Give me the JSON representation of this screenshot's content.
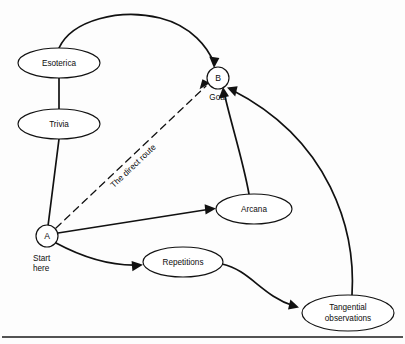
{
  "diagram": {
    "background_color": "#fdfdfd",
    "line_color": "#111111",
    "nodes": [
      {
        "id": "esoterica",
        "label": "Esoterica",
        "shape": "ellipse",
        "cx": 59,
        "cy": 63,
        "rx": 41,
        "ry": 15
      },
      {
        "id": "trivia",
        "label": "Trivia",
        "shape": "ellipse",
        "cx": 59,
        "cy": 124,
        "rx": 41,
        "ry": 15
      },
      {
        "id": "b",
        "label": "B",
        "caption": "Goal",
        "shape": "circle",
        "cx": 218,
        "cy": 78,
        "rx": 11,
        "ry": 11
      },
      {
        "id": "a",
        "label": "A",
        "caption_line1": "Start",
        "caption_line2": "here",
        "shape": "circle",
        "cx": 47,
        "cy": 236,
        "rx": 11,
        "ry": 11
      },
      {
        "id": "arcana",
        "label": "Arcana",
        "shape": "ellipse",
        "cx": 254,
        "cy": 209,
        "rx": 38,
        "ry": 15
      },
      {
        "id": "repetitions",
        "label": "Repetitions",
        "shape": "ellipse",
        "cx": 183,
        "cy": 262,
        "rx": 40,
        "ry": 15
      },
      {
        "id": "tangential",
        "label_line1": "Tangential",
        "label_line2": "observations",
        "shape": "ellipse",
        "cx": 348,
        "cy": 313,
        "rx": 46,
        "ry": 18
      }
    ],
    "edges": [
      {
        "id": "esoterica-to-b",
        "from": "esoterica",
        "to": "b",
        "style": "solid-curve",
        "arrow": true
      },
      {
        "id": "esoterica-to-trivia",
        "from": "esoterica",
        "to": "trivia",
        "style": "solid-line",
        "arrow": false
      },
      {
        "id": "trivia-to-a",
        "from": "trivia",
        "to": "a",
        "style": "solid-line",
        "arrow": false
      },
      {
        "id": "a-to-b-direct",
        "from": "a",
        "to": "b",
        "style": "dashed",
        "arrow": true,
        "label": "The direct route"
      },
      {
        "id": "a-to-arcana",
        "from": "a",
        "to": "arcana",
        "style": "solid-line",
        "arrow": true
      },
      {
        "id": "a-to-repetitions",
        "from": "a",
        "to": "repetitions",
        "style": "solid-curve",
        "arrow": true
      },
      {
        "id": "arcana-to-b",
        "from": "arcana",
        "to": "b",
        "style": "solid-curve",
        "arrow": true
      },
      {
        "id": "repetitions-to-tangential",
        "from": "repetitions",
        "to": "tangential",
        "style": "solid-curve",
        "arrow": true
      },
      {
        "id": "tangential-to-b",
        "from": "tangential",
        "to": "b",
        "style": "solid-curve",
        "arrow": true
      }
    ],
    "edge_label_direct_route": "The direct route",
    "bottom_rule_visible": true
  }
}
